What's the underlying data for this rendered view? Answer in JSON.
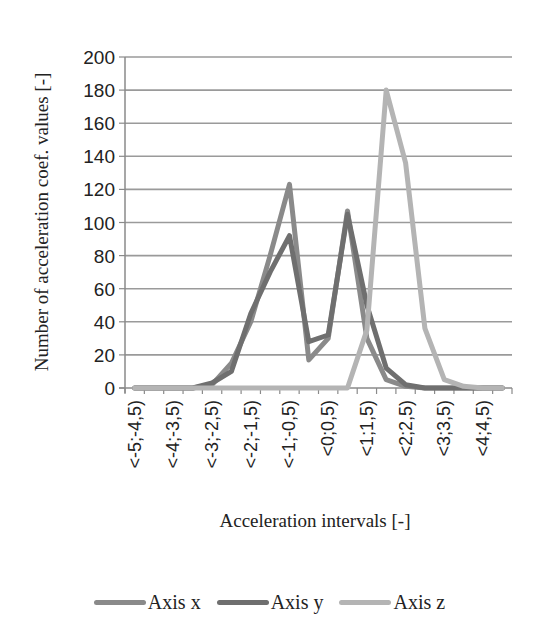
{
  "chart_data": {
    "type": "line",
    "title": "",
    "xlabel": "Acceleration intervals [-]",
    "ylabel": "Number of acceleration coef. values [-]",
    "ylim": [
      0,
      200
    ],
    "yticks": [
      0,
      20,
      40,
      60,
      80,
      100,
      120,
      140,
      160,
      180,
      200
    ],
    "grid": true,
    "legend_position": "bottom",
    "categories": [
      "<-5;-4,5)",
      "<-4,5;-4)",
      "<-4;-3,5)",
      "<-3,5;-3)",
      "<-3;-2,5)",
      "<-2,5;-2)",
      "<-2;-1,5)",
      "<-1,5;-1)",
      "<-1;-0,5)",
      "<-0,5;0)",
      "<0;0,5)",
      "<0,5;1)",
      "<1;1,5)",
      "<1,5;2)",
      "<2;2,5)",
      "<2,5;3)",
      "<3;3,5)",
      "<3,5;4)",
      "<4;4,5)",
      "<4,5;5)"
    ],
    "visible_tick_labels": [
      "<-5;-4,5)",
      "<-4;-3,5)",
      "<-3;-2,5)",
      "<-2;-1,5)",
      "<-1;-0,5)",
      "<0;0,5)",
      "<1;1,5)",
      "<2;2,5)",
      "<3;3,5)",
      "<4;4,5)"
    ],
    "series": [
      {
        "name": "Axis x",
        "color": "#8a8a8a",
        "values": [
          0,
          0,
          0,
          0,
          2,
          15,
          40,
          80,
          123,
          17,
          30,
          107,
          30,
          5,
          1,
          0,
          0,
          0,
          0,
          0
        ]
      },
      {
        "name": "Axis y",
        "color": "#6f6f6f",
        "values": [
          0,
          0,
          0,
          0,
          3,
          10,
          45,
          70,
          92,
          28,
          32,
          105,
          50,
          12,
          2,
          0,
          0,
          0,
          0,
          0
        ]
      },
      {
        "name": "Axis z",
        "color": "#b4b4b4",
        "values": [
          0,
          0,
          0,
          0,
          0,
          0,
          0,
          0,
          0,
          0,
          0,
          0,
          35,
          180,
          136,
          36,
          5,
          1,
          0,
          0
        ]
      }
    ]
  },
  "legend": {
    "items": [
      {
        "label": "Axis x",
        "color": "#8a8a8a"
      },
      {
        "label": "Axis y",
        "color": "#6f6f6f"
      },
      {
        "label": "Axis z",
        "color": "#b4b4b4"
      }
    ]
  }
}
